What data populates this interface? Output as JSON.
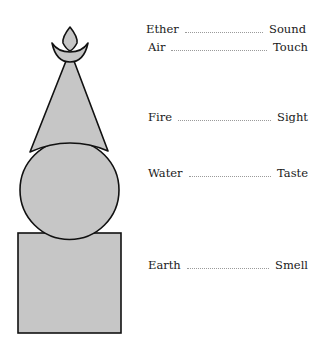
{
  "diagram": {
    "shapes": [
      {
        "name": "finial-flame",
        "represents": "Ether"
      },
      {
        "name": "crescent",
        "represents": "Air"
      },
      {
        "name": "cone",
        "represents": "Fire"
      },
      {
        "name": "sphere",
        "represents": "Water"
      },
      {
        "name": "cube",
        "represents": "Earth"
      }
    ],
    "fill_color": "#c6c6c6",
    "stroke_color": "#111111"
  },
  "correspondences": [
    {
      "element": "Ether",
      "sense": "Sound"
    },
    {
      "element": "Air",
      "sense": "Touch"
    },
    {
      "element": "Fire",
      "sense": "Sight"
    },
    {
      "element": "Water",
      "sense": "Taste"
    },
    {
      "element": "Earth",
      "sense": "Smell"
    }
  ]
}
